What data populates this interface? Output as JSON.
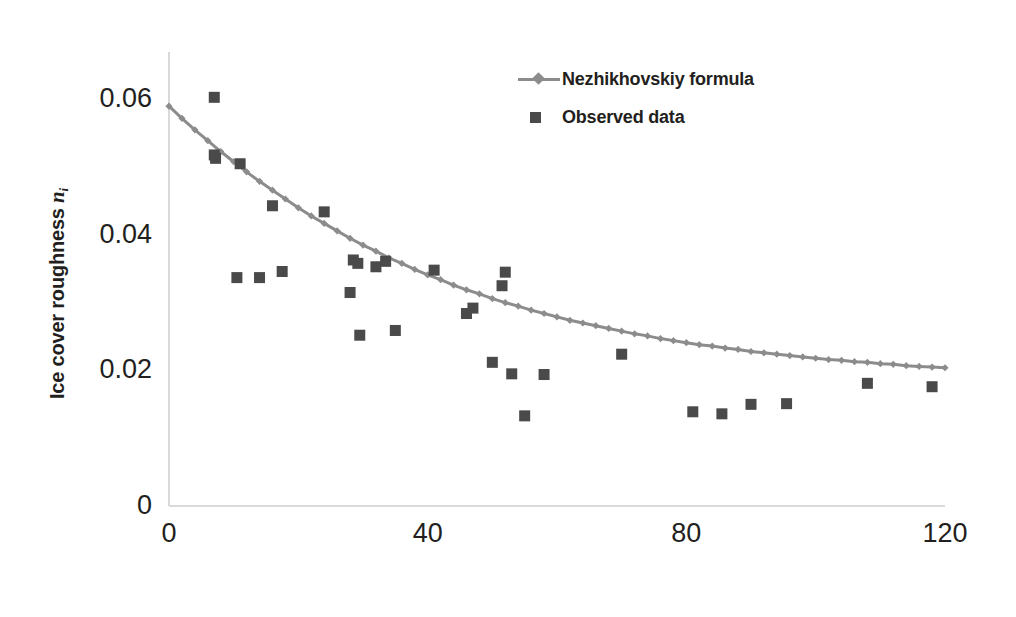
{
  "chart_data": {
    "type": "scatter",
    "title": "",
    "xlabel": "Number of days after the river has frozen",
    "ylabel": "Ice cover roughness n_i",
    "ylabel_text": "Ice cover roughness ",
    "ylabel_symbol": "n",
    "ylabel_subscript": "i",
    "xlim": [
      0,
      120
    ],
    "ylim": [
      0,
      0.065
    ],
    "xticks": [
      0,
      40,
      80,
      120
    ],
    "xtick_labels": [
      "0",
      "40",
      "80",
      "120"
    ],
    "yticks": [
      0,
      0.02,
      0.04,
      0.06
    ],
    "ytick_labels": [
      "0",
      "0.02",
      "0.04",
      "0.06"
    ],
    "grid": false,
    "legend_position": "top-right",
    "series": [
      {
        "name": "Nezhikhovskiy formula",
        "type": "line",
        "marker": "diamond",
        "color": "#8c8c8c",
        "x": [
          0,
          2,
          4,
          6,
          8,
          10,
          12,
          14,
          16,
          18,
          20,
          22,
          24,
          26,
          28,
          30,
          32,
          34,
          36,
          38,
          40,
          42,
          44,
          46,
          48,
          50,
          52,
          54,
          56,
          58,
          60,
          62,
          64,
          66,
          68,
          70,
          72,
          74,
          76,
          78,
          80,
          82,
          84,
          86,
          88,
          90,
          92,
          94,
          96,
          98,
          100,
          102,
          104,
          106,
          108,
          110,
          112,
          114,
          116,
          118,
          120
        ],
        "y": [
          0.059,
          0.0572,
          0.0555,
          0.0539,
          0.0523,
          0.0508,
          0.0493,
          0.0479,
          0.0466,
          0.0453,
          0.044,
          0.0428,
          0.0417,
          0.0406,
          0.0395,
          0.0385,
          0.0376,
          0.0366,
          0.0358,
          0.0349,
          0.0341,
          0.0334,
          0.0326,
          0.0319,
          0.0313,
          0.0306,
          0.03,
          0.0295,
          0.0289,
          0.0284,
          0.0279,
          0.0274,
          0.027,
          0.0266,
          0.0262,
          0.0258,
          0.0254,
          0.0251,
          0.0247,
          0.0244,
          0.0241,
          0.0238,
          0.0236,
          0.0233,
          0.0231,
          0.0228,
          0.0226,
          0.0224,
          0.0222,
          0.022,
          0.0218,
          0.0216,
          0.0215,
          0.0213,
          0.0212,
          0.021,
          0.0209,
          0.0207,
          0.0206,
          0.0205,
          0.0204
        ]
      },
      {
        "name": "Observed data",
        "type": "scatter",
        "marker": "square",
        "color": "#4a4a4a",
        "x": [
          7.0,
          7.0,
          7.2,
          11.0,
          10.5,
          14.0,
          16.0,
          17.5,
          24.0,
          28.0,
          28.5,
          29.2,
          29.5,
          32.0,
          33.5,
          35.0,
          41.0,
          46.0,
          47.0,
          50.0,
          51.5,
          52.0,
          53.0,
          55.0,
          58.0,
          70.0,
          81.0,
          85.5,
          90.0,
          95.5,
          108.0,
          118.0
        ],
        "y": [
          0.0603,
          0.0518,
          0.0513,
          0.0505,
          0.0337,
          0.0337,
          0.0443,
          0.0346,
          0.0434,
          0.0315,
          0.0363,
          0.0358,
          0.0252,
          0.0353,
          0.0361,
          0.0259,
          0.0348,
          0.0284,
          0.0292,
          0.0212,
          0.0325,
          0.0345,
          0.0195,
          0.0133,
          0.0194,
          0.0224,
          0.0139,
          0.0136,
          0.015,
          0.0151,
          0.0181,
          0.0176
        ]
      }
    ]
  },
  "legend": {
    "items": [
      {
        "label": "Nezhikhovskiy formula",
        "key": "line-diamond-marker",
        "color": "#8c8c8c"
      },
      {
        "label": "Observed data",
        "key": "square-marker",
        "color": "#4a4a4a"
      }
    ]
  },
  "axes": {
    "y_title_prefix": "Ice cover roughness ",
    "y_title_symbol": "n",
    "y_title_subscript": "i",
    "x_title": "Number of days after the river has frozen"
  },
  "colors": {
    "line": "#8c8c8c",
    "marker": "#4a4a4a",
    "axis": "#d9d9d9",
    "text": "#231f20",
    "background": "#ffffff"
  }
}
